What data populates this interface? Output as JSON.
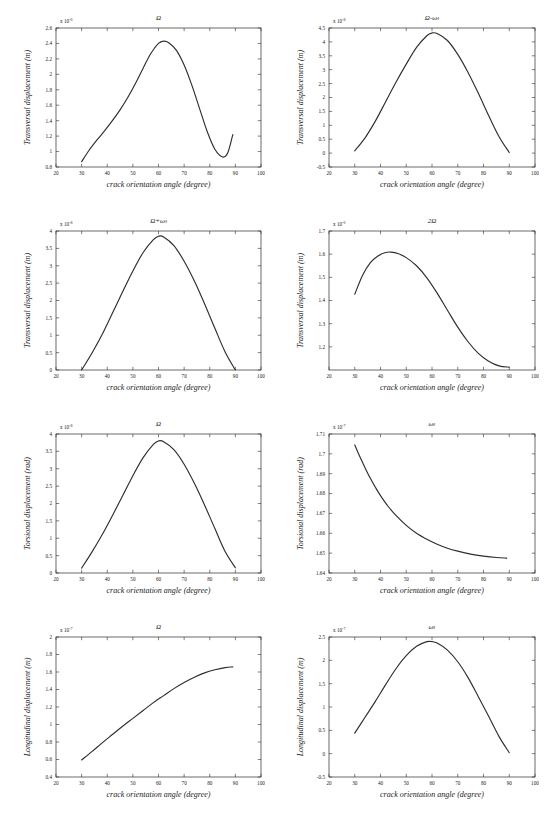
{
  "figure": {
    "panel_count": 8,
    "columns": 2,
    "rows": 4,
    "line_color": "#2e2e2e",
    "axis_color": "#2b2b2b",
    "background": "#ffffff"
  },
  "common": {
    "xlabel": "crack orientation angle (degree)",
    "xlim": [
      20,
      100
    ],
    "xticks": [
      20,
      30,
      40,
      50,
      60,
      70,
      80,
      90,
      100
    ],
    "xticklabels": [
      "20",
      "30",
      "40",
      "50",
      "60",
      "70",
      "80",
      "90",
      "100"
    ],
    "exponent_prefix": "x 10"
  },
  "chart_data": [
    {
      "id": "panel-1",
      "type": "line",
      "title": "Ω",
      "xlabel": "crack orientation angle (degree)",
      "ylabel": "Transversal displacement (m)",
      "xlim": [
        20,
        100
      ],
      "ylim": [
        0.8,
        2.6
      ],
      "yexp": "-6",
      "yexp_label": "x 10⁻⁶",
      "yticks": [
        0.8,
        1,
        1.2,
        1.4,
        1.6,
        1.8,
        2,
        2.2,
        2.4,
        2.6
      ],
      "yticklabels": [
        "0.8",
        "1",
        "1.2",
        "1.4",
        "1.6",
        "1.8",
        "2",
        "2.2",
        "2.4",
        "2.6"
      ],
      "grid": false,
      "x": [
        30,
        33,
        36,
        39,
        42,
        45,
        48,
        51,
        54,
        57,
        60,
        62,
        64,
        67,
        70,
        73,
        76,
        79,
        82,
        85,
        87,
        89
      ],
      "y": [
        0.87,
        1.02,
        1.15,
        1.27,
        1.4,
        1.54,
        1.7,
        1.88,
        2.08,
        2.27,
        2.4,
        2.43,
        2.41,
        2.31,
        2.12,
        1.86,
        1.56,
        1.26,
        1.03,
        0.93,
        0.98,
        1.22
      ]
    },
    {
      "id": "panel-2",
      "type": "line",
      "title": "Ω-ωₜ",
      "xlabel": "crack orientation angle (degree)",
      "ylabel": "Transversal displacement (m)",
      "xlim": [
        20,
        100
      ],
      "ylim": [
        -0.5,
        4.5
      ],
      "yexp": "-8",
      "yexp_label": "x 10⁻⁸",
      "yticks": [
        -0.5,
        0,
        0.5,
        1,
        1.5,
        2,
        2.5,
        3,
        3.5,
        4,
        4.5
      ],
      "yticklabels": [
        "-0.5",
        "0",
        "0.5",
        "1",
        "1.5",
        "2",
        "2.5",
        "3",
        "3.5",
        "4",
        "4.5"
      ],
      "grid": false,
      "x": [
        30,
        34,
        38,
        42,
        46,
        50,
        54,
        58,
        60,
        62,
        66,
        70,
        74,
        78,
        82,
        86,
        90
      ],
      "y": [
        0.08,
        0.55,
        1.15,
        1.85,
        2.55,
        3.2,
        3.8,
        4.22,
        4.32,
        4.3,
        4.05,
        3.55,
        2.9,
        2.15,
        1.35,
        0.6,
        0.02
      ]
    },
    {
      "id": "panel-3",
      "type": "line",
      "title": "Ω+ωₜ",
      "xlabel": "crack orientation angle (degree)",
      "ylabel": "Transversal displacement (m)",
      "xlim": [
        20,
        100
      ],
      "ylim": [
        0,
        4
      ],
      "yexp": "-8",
      "yexp_label": "x 10⁻⁸",
      "yticks": [
        0,
        0.5,
        1,
        1.5,
        2,
        2.5,
        3,
        3.5,
        4
      ],
      "yticklabels": [
        "0",
        "0.5",
        "1",
        "1.5",
        "2",
        "2.5",
        "3",
        "3.5",
        "4"
      ],
      "grid": false,
      "x": [
        30,
        34,
        38,
        42,
        46,
        50,
        54,
        58,
        60,
        62,
        66,
        70,
        74,
        78,
        82,
        86,
        90
      ],
      "y": [
        0.0,
        0.48,
        1.02,
        1.63,
        2.25,
        2.85,
        3.38,
        3.75,
        3.85,
        3.83,
        3.58,
        3.13,
        2.56,
        1.9,
        1.2,
        0.52,
        0.0
      ]
    },
    {
      "id": "panel-4",
      "type": "line",
      "title": "2Ω",
      "xlabel": "crack orientation angle (degree)",
      "ylabel": "Transversal displacement (m)",
      "xlim": [
        20,
        100
      ],
      "ylim": [
        1.1,
        1.7
      ],
      "yexp": "-6",
      "yexp_label": "x 10⁻⁶",
      "yticks": [
        1.2,
        1.3,
        1.4,
        1.5,
        1.6,
        1.7
      ],
      "yticklabels": [
        "1.2",
        "1.3",
        "1.4",
        "1.5",
        "1.6",
        "1.7"
      ],
      "grid": false,
      "x": [
        30,
        33,
        36,
        39,
        42,
        44,
        47,
        50,
        54,
        58,
        62,
        66,
        70,
        74,
        78,
        82,
        86,
        90
      ],
      "y": [
        1.427,
        1.508,
        1.562,
        1.592,
        1.607,
        1.609,
        1.602,
        1.585,
        1.55,
        1.498,
        1.432,
        1.358,
        1.285,
        1.222,
        1.172,
        1.138,
        1.118,
        1.112
      ]
    },
    {
      "id": "panel-5",
      "type": "line",
      "title": "Ω",
      "xlabel": "crack orientation angle (degree)",
      "ylabel": "Torsional displacement (rad)",
      "xlim": [
        20,
        100
      ],
      "ylim": [
        0,
        4
      ],
      "yexp": "-8",
      "yexp_label": "x 10⁻⁸",
      "yticks": [
        0,
        0.5,
        1,
        1.5,
        2,
        2.5,
        3,
        3.5,
        4
      ],
      "yticklabels": [
        "0",
        "0.5",
        "1",
        "1.5",
        "2",
        "2.5",
        "3",
        "3.5",
        "4"
      ],
      "grid": false,
      "x": [
        30,
        34,
        38,
        42,
        46,
        50,
        54,
        58,
        60,
        62,
        66,
        70,
        74,
        78,
        82,
        86,
        90
      ],
      "y": [
        0.14,
        0.6,
        1.1,
        1.65,
        2.22,
        2.8,
        3.32,
        3.7,
        3.8,
        3.78,
        3.55,
        3.13,
        2.58,
        1.95,
        1.28,
        0.62,
        0.15
      ]
    },
    {
      "id": "panel-6",
      "type": "line",
      "title": "ωₜ",
      "xlabel": "crack orientation angle (degree)",
      "ylabel": "Torsional displacement (rad)",
      "xlim": [
        20,
        100
      ],
      "ylim": [
        1.64,
        1.71
      ],
      "yexp": "-7",
      "yexp_label": "x 10⁻⁷",
      "yticks": [
        1.64,
        1.65,
        1.66,
        1.67,
        1.68,
        1.69,
        1.7,
        1.71
      ],
      "yticklabels": [
        "1.64",
        "1.65",
        "1.66",
        "1.67",
        "1.68",
        "1.69",
        "1.7",
        "1.71"
      ],
      "grid": false,
      "x": [
        30,
        32,
        34,
        36,
        38,
        40,
        43,
        46,
        50,
        54,
        58,
        62,
        66,
        70,
        75,
        80,
        85,
        89
      ],
      "y": [
        1.7045,
        1.6985,
        1.693,
        1.6878,
        1.6832,
        1.679,
        1.6735,
        1.669,
        1.664,
        1.66,
        1.657,
        1.6545,
        1.6525,
        1.651,
        1.6495,
        1.6485,
        1.6478,
        1.6475
      ]
    },
    {
      "id": "panel-7",
      "type": "line",
      "title": "Ω",
      "xlabel": "crack orientation angle (degree)",
      "ylabel": "Longitudinal displacement (m)",
      "xlim": [
        20,
        100
      ],
      "ylim": [
        0.4,
        2
      ],
      "yexp": "-7",
      "yexp_label": "x 10⁻⁷",
      "yticks": [
        0.4,
        0.6,
        0.8,
        1,
        1.2,
        1.4,
        1.6,
        1.8,
        2
      ],
      "yticklabels": [
        "0.4",
        "0.6",
        "0.8",
        "1",
        "1.2",
        "1.4",
        "1.6",
        "1.8",
        "2"
      ],
      "grid": false,
      "x": [
        30,
        34,
        38,
        42,
        46,
        50,
        54,
        58,
        62,
        66,
        70,
        74,
        78,
        82,
        86,
        89
      ],
      "y": [
        0.595,
        0.69,
        0.79,
        0.885,
        0.98,
        1.07,
        1.16,
        1.25,
        1.33,
        1.41,
        1.48,
        1.54,
        1.59,
        1.625,
        1.65,
        1.658
      ]
    },
    {
      "id": "panel-8",
      "type": "line",
      "title": "ωₜ",
      "xlabel": "crack orientation angle (degree)",
      "ylabel": "Longitudinal displacement (m)",
      "xlim": [
        20,
        100
      ],
      "ylim": [
        -0.5,
        2.5
      ],
      "yexp": "-7",
      "yexp_label": "x 10⁻⁷",
      "yticks": [
        -0.5,
        0,
        0.5,
        1,
        1.5,
        2,
        2.5
      ],
      "yticklabels": [
        "-0.5",
        "0",
        "0.5",
        "1",
        "1.5",
        "2",
        "2.5"
      ],
      "grid": false,
      "x": [
        30,
        34,
        38,
        42,
        46,
        50,
        54,
        58,
        60,
        62,
        66,
        70,
        74,
        78,
        82,
        86,
        90
      ],
      "y": [
        0.44,
        0.78,
        1.12,
        1.48,
        1.82,
        2.1,
        2.3,
        2.4,
        2.4,
        2.37,
        2.22,
        1.97,
        1.63,
        1.22,
        0.8,
        0.37,
        0.02
      ]
    }
  ]
}
